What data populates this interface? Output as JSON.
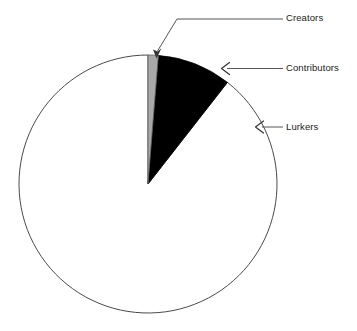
{
  "chart_data": {
    "type": "pie",
    "title": "",
    "categories": [
      "Creators",
      "Contributors",
      "Lurkers"
    ],
    "values": [
      1.3,
      9.3,
      89.4
    ],
    "units": "percent",
    "colors": [
      "#a8a8a8",
      "#000000",
      "#ffffff"
    ],
    "stroke": "#4a4a4a",
    "start_angle_deg": 0,
    "direction": "clockwise",
    "legend": "annotated-callouts-right",
    "grid": false,
    "slices": [
      {
        "label": "Creators",
        "value": 1.3,
        "color": "#a8a8a8",
        "start_angle_deg": 0.0,
        "end_angle_deg": 4.6
      },
      {
        "label": "Contributors",
        "value": 9.3,
        "color": "#000000",
        "start_angle_deg": 4.6,
        "end_angle_deg": 38.0
      },
      {
        "label": "Lurkers",
        "value": 89.4,
        "color": "#ffffff",
        "start_angle_deg": 38.0,
        "end_angle_deg": 360.0
      }
    ]
  },
  "geometry": {
    "center_x": 148,
    "center_y": 184,
    "radius": 129
  },
  "annotations": {
    "creators": {
      "label": "Creators",
      "arrow_style": "elbow-down-left"
    },
    "contributors": {
      "label": "Contributors",
      "arrow_style": "straight-left"
    },
    "lurkers": {
      "label": "Lurkers",
      "arrow_style": "straight-left"
    }
  }
}
